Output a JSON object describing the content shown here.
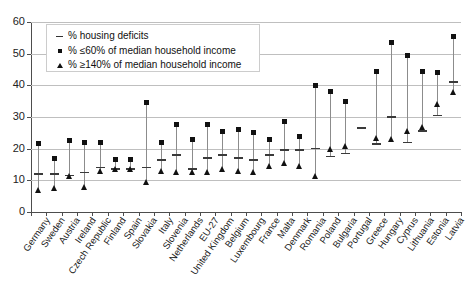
{
  "chart_data": {
    "type": "scatter",
    "title": "",
    "xlabel": "",
    "ylabel": "",
    "ylim": [
      0,
      60
    ],
    "yticks": [
      0,
      10,
      20,
      30,
      40,
      50,
      60
    ],
    "grid": true,
    "legend_position": "top-left",
    "categories": [
      "Germany",
      "Sweden",
      "Austria",
      "Ireland",
      "Czech Republic",
      "Finland",
      "Spain",
      "Slovakia",
      "Italy",
      "Slovenia",
      "Netherlands",
      "EU-27",
      "United Kingdom",
      "Belgium",
      "Luxembourg",
      "France",
      "Malta",
      "Denmark",
      "Romania",
      "Poland",
      "Bulgaria",
      "Portugal",
      "Greece",
      "Hungary",
      "Cyprus",
      "Lithuania",
      "Estonia",
      "Latvia"
    ],
    "series": [
      {
        "name": "% housing deficits",
        "marker": "dash",
        "values": [
          12.0,
          12.0,
          11.5,
          12.5,
          14.0,
          13.5,
          13.5,
          14.0,
          16.5,
          18.0,
          13.5,
          17.0,
          18.0,
          17.0,
          16.5,
          18.0,
          19.5,
          19.5,
          20.0,
          17.5,
          18.5,
          26.5,
          21.5,
          30.0,
          22.0,
          25.5,
          30.5,
          41.0
        ]
      },
      {
        "name": "% ≤60% of median household income",
        "marker": "square",
        "values": [
          21.5,
          17.0,
          22.5,
          22.0,
          22.0,
          16.5,
          16.5,
          34.5,
          22.0,
          27.5,
          23.0,
          27.5,
          25.5,
          26.0,
          25.0,
          23.0,
          28.5,
          24.0,
          40.0,
          38.0,
          35.0,
          null,
          44.5,
          53.5,
          49.5,
          44.5,
          44.0,
          55.5
        ]
      },
      {
        "name": "% ≥140% of median household income",
        "marker": "triangle",
        "values": [
          7.0,
          7.5,
          11.5,
          8.0,
          13.0,
          13.5,
          13.5,
          9.5,
          13.0,
          12.5,
          12.5,
          12.5,
          13.5,
          13.0,
          12.5,
          14.5,
          15.5,
          14.5,
          11.5,
          20.0,
          21.0,
          null,
          23.5,
          23.0,
          25.5,
          27.0,
          34.0,
          38.0
        ]
      }
    ]
  },
  "legend": {
    "items": [
      {
        "marker": "dash",
        "label": "% housing deficits"
      },
      {
        "marker": "square",
        "label": "% ≤60% of median household income"
      },
      {
        "marker": "triangle",
        "label": "% ≥140% of median household income"
      }
    ]
  }
}
